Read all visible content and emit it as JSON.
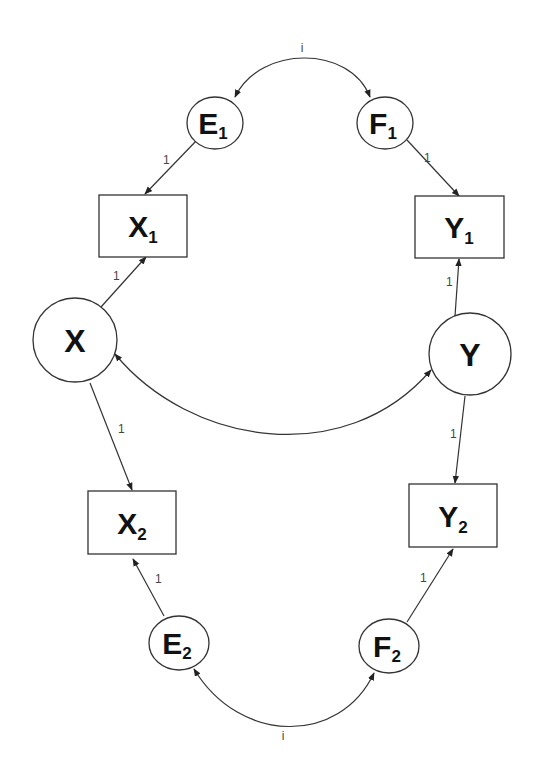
{
  "diagram": {
    "type": "path-diagram",
    "nodes": {
      "E1": {
        "letter": "E",
        "sub": "1",
        "shape": "ellipse"
      },
      "F1": {
        "letter": "F",
        "sub": "1",
        "shape": "ellipse"
      },
      "X1": {
        "letter": "X",
        "sub": "1",
        "shape": "rectangle"
      },
      "Y1": {
        "letter": "Y",
        "sub": "1",
        "shape": "rectangle"
      },
      "X": {
        "letter": "X",
        "sub": "",
        "shape": "circle"
      },
      "Y": {
        "letter": "Y",
        "sub": "",
        "shape": "circle"
      },
      "X2": {
        "letter": "X",
        "sub": "2",
        "shape": "rectangle"
      },
      "Y2": {
        "letter": "Y",
        "sub": "2",
        "shape": "rectangle"
      },
      "E2": {
        "letter": "E",
        "sub": "2",
        "shape": "ellipse"
      },
      "F2": {
        "letter": "F",
        "sub": "2",
        "shape": "ellipse"
      }
    },
    "edge_labels": {
      "E1_F1_cov": "i",
      "E1_X1": "1",
      "F1_Y1": "1",
      "X_X1": "1",
      "Y_Y1": "1",
      "X_X2": "1",
      "Y_Y2": "1",
      "E2_X2": "1",
      "F2_Y2": "1",
      "E2_F2_cov": "i"
    },
    "edges": [
      {
        "from": "E1",
        "to": "F1",
        "kind": "bidirectional",
        "label": "i"
      },
      {
        "from": "E1",
        "to": "X1",
        "kind": "directed",
        "label": "1"
      },
      {
        "from": "F1",
        "to": "Y1",
        "kind": "directed",
        "label": "1"
      },
      {
        "from": "X",
        "to": "X1",
        "kind": "directed",
        "label": "1"
      },
      {
        "from": "Y",
        "to": "Y1",
        "kind": "directed",
        "label": "1"
      },
      {
        "from": "X",
        "to": "Y",
        "kind": "bidirectional",
        "label": ""
      },
      {
        "from": "X",
        "to": "X2",
        "kind": "directed",
        "label": "1"
      },
      {
        "from": "Y",
        "to": "Y2",
        "kind": "directed",
        "label": "1"
      },
      {
        "from": "E2",
        "to": "X2",
        "kind": "directed",
        "label": "1"
      },
      {
        "from": "F2",
        "to": "Y2",
        "kind": "directed",
        "label": "1"
      },
      {
        "from": "E2",
        "to": "F2",
        "kind": "bidirectional",
        "label": "i"
      }
    ]
  }
}
